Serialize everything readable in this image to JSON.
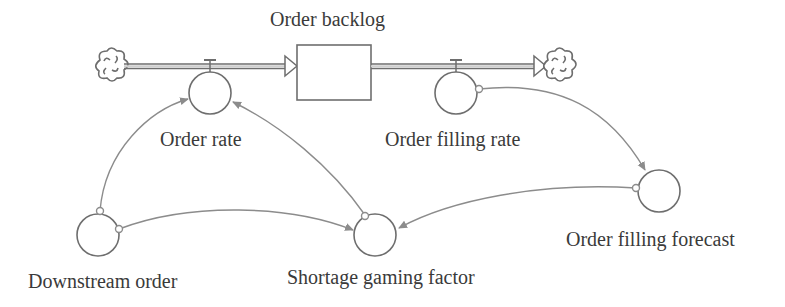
{
  "diagram": {
    "type": "stock-and-flow",
    "colors": {
      "stroke": "#6e6e6e",
      "link": "#8c8c8c",
      "text": "#3a3a3a",
      "background": "#ffffff"
    },
    "stocks": [
      {
        "id": "order_backlog",
        "label": "Order backlog"
      }
    ],
    "flows": [
      {
        "id": "order_rate",
        "label": "Order rate",
        "from": "source-cloud",
        "to": "order_backlog"
      },
      {
        "id": "order_filling_rate",
        "label": "Order filling rate",
        "from": "order_backlog",
        "to": "sink-cloud"
      }
    ],
    "auxiliaries": [
      {
        "id": "downstream_order",
        "label": "Downstream order"
      },
      {
        "id": "shortage_gaming_factor",
        "label": "Shortage gaming factor"
      },
      {
        "id": "order_filling_forecast",
        "label": "Order filling forecast"
      }
    ],
    "links": [
      {
        "from": "Downstream order",
        "to": "Order rate"
      },
      {
        "from": "Downstream order",
        "to": "Shortage gaming factor"
      },
      {
        "from": "Shortage gaming factor",
        "to": "Order rate"
      },
      {
        "from": "Order filling rate",
        "to": "Order filling forecast"
      },
      {
        "from": "Order filling forecast",
        "to": "Shortage gaming factor"
      }
    ],
    "icons": {
      "source": "cloud-icon",
      "sink": "cloud-icon",
      "valve": "valve-icon"
    }
  }
}
